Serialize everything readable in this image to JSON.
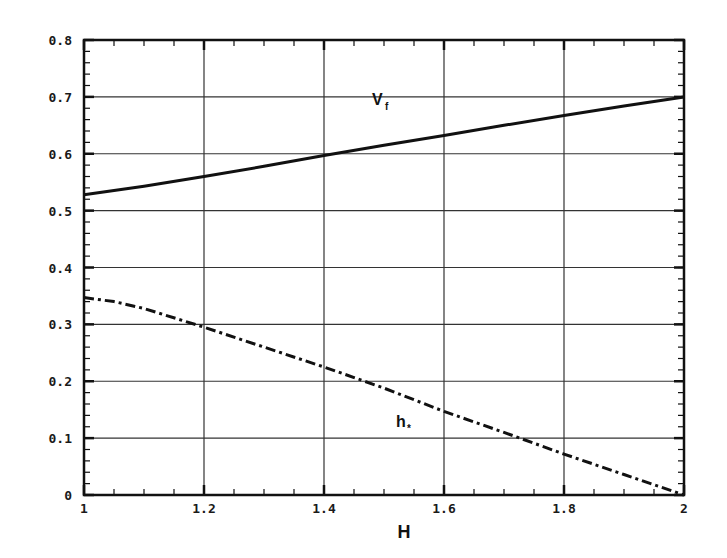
{
  "chart_data": {
    "type": "line",
    "title": "",
    "xlabel": "H",
    "ylabel": "",
    "xlim": [
      1,
      2
    ],
    "ylim": [
      0,
      0.8
    ],
    "grid": true,
    "legend": "inline labels",
    "x_ticks": [
      "1",
      "1.2",
      "1.4",
      "1.6",
      "1.8",
      "2"
    ],
    "y_ticks": [
      "0",
      "0.1",
      "0.2",
      "0.3",
      "0.4",
      "0.5",
      "0.6",
      "0.7",
      "0.8"
    ],
    "series": [
      {
        "name": "Vf",
        "label_main": "V",
        "label_sub": "f",
        "style": "solid",
        "x": [
          1.0,
          1.1,
          1.2,
          1.3,
          1.4,
          1.5,
          1.6,
          1.7,
          1.8,
          1.9,
          2.0
        ],
        "values": [
          0.528,
          0.543,
          0.56,
          0.578,
          0.597,
          0.615,
          0.632,
          0.65,
          0.667,
          0.684,
          0.7
        ]
      },
      {
        "name": "h*",
        "label_main": "h",
        "label_sub": "*",
        "style": "dash-dot",
        "x": [
          1.0,
          1.05,
          1.1,
          1.2,
          1.3,
          1.4,
          1.5,
          1.6,
          1.7,
          1.8,
          1.9,
          2.0
        ],
        "values": [
          0.347,
          0.34,
          0.328,
          0.295,
          0.26,
          0.225,
          0.188,
          0.147,
          0.11,
          0.072,
          0.036,
          0.0
        ]
      }
    ],
    "annotations": [
      {
        "text": "Vf",
        "x": 1.48,
        "y": 0.685
      },
      {
        "text": "h*",
        "x": 1.52,
        "y": 0.12
      }
    ]
  },
  "colors": {
    "line": "#111111",
    "grid": "#333333",
    "background": "#ffffff"
  }
}
